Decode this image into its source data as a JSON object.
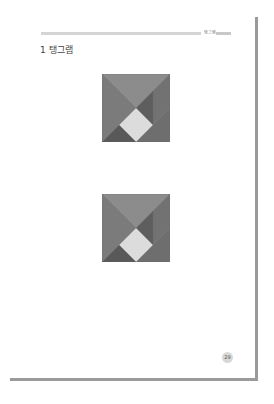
{
  "header": {
    "section_label": "탱그램"
  },
  "heading": {
    "text": "1 탱그램"
  },
  "figures": [
    {
      "name": "tangram-figure-1",
      "top": 74,
      "pieces": [
        {
          "name": "top-large-triangle",
          "points": "0,0 68,0 34,34",
          "fill": "#8c8c8c"
        },
        {
          "name": "left-large-triangle",
          "points": "0,0 34,34 0,68",
          "fill": "#7b7b7b"
        },
        {
          "name": "right-parallelogram",
          "points": "68,0 68,34 51,51 51,17",
          "fill": "#727272"
        },
        {
          "name": "center-medium-triangle",
          "points": "34,34 51,17 51,51",
          "fill": "#5e5e5e"
        },
        {
          "name": "bottom-right-triangle",
          "points": "68,34 68,68 34,68",
          "fill": "#6e6e6e"
        },
        {
          "name": "center-square",
          "points": "34,34 51,51 34,68 17,51",
          "fill": "#dcdcdc"
        },
        {
          "name": "bottom-left-small-triangle",
          "points": "0,68 17,51 34,68",
          "fill": "#595959"
        }
      ]
    },
    {
      "name": "tangram-figure-2",
      "top": 194,
      "pieces": [
        {
          "name": "top-large-triangle",
          "points": "0,0 68,0 34,34",
          "fill": "#8c8c8c"
        },
        {
          "name": "left-large-triangle",
          "points": "0,0 34,34 0,68",
          "fill": "#7b7b7b"
        },
        {
          "name": "right-parallelogram",
          "points": "68,0 68,34 51,51 51,17",
          "fill": "#727272"
        },
        {
          "name": "center-medium-triangle",
          "points": "34,34 51,17 51,51",
          "fill": "#5e5e5e"
        },
        {
          "name": "bottom-right-triangle",
          "points": "68,34 68,68 34,68",
          "fill": "#6e6e6e"
        },
        {
          "name": "center-square",
          "points": "34,34 51,51 34,68 17,51",
          "fill": "#dcdcdc"
        },
        {
          "name": "bottom-left-small-triangle",
          "points": "0,68 17,51 34,68",
          "fill": "#595959"
        }
      ]
    }
  ],
  "footer": {
    "page_number": "29"
  },
  "colors": {
    "border": "#9a9a9a",
    "header_rule": "#d4d4d4"
  }
}
